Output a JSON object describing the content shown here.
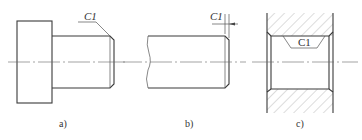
{
  "figure": {
    "panels": [
      {
        "id": "a",
        "caption": "a)",
        "chamfer_label": "C1",
        "description": "Stepped shaft with chamfered end"
      },
      {
        "id": "b",
        "caption": "b)",
        "chamfer_label": "C1",
        "description": "Shaft end with chamfer dimension"
      },
      {
        "id": "c",
        "caption": "c)",
        "chamfer_label": "C1",
        "description": "Sectioned bore with chamfered edges"
      }
    ]
  },
  "colors": {
    "line": "#3a3a3a",
    "hatch": "#8a8a8a",
    "background": "#ffffff"
  }
}
